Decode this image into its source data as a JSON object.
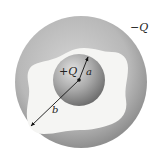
{
  "figure": {
    "labels": {
      "outer_charge": "−Q",
      "inner_charge": "+Q",
      "inner_radius": "a",
      "outer_radius": "b"
    },
    "colors": {
      "outer_shell_edge": "#8c8c8c",
      "outer_shell_mid": "#b5b5b5",
      "outer_shell_light": "#cfcfcf",
      "cavity": "#f4f4f2",
      "inner_sphere_light": "#d6d6d6",
      "inner_sphere_dark": "#7a7a7a",
      "arrow": "#111111"
    }
  }
}
